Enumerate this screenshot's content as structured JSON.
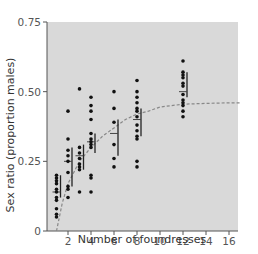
{
  "chart_data": {
    "type": "scatter",
    "title": "",
    "xlabel": "Number of foundresses",
    "ylabel": "Sex ratio (proportion males)",
    "xlim": [
      0,
      18
    ],
    "ylim": [
      0,
      0.75
    ],
    "x_ticks": [
      2,
      4,
      6,
      8,
      10,
      12,
      14,
      16
    ],
    "y_ticks": [
      0,
      0.25,
      0.5,
      0.75
    ],
    "y_tick_labels": [
      "0",
      "0.25",
      "0.50",
      "0.75"
    ],
    "grid": false,
    "background": "#d9d9d9",
    "series": [
      {
        "name": "observations",
        "points": [
          [
            1,
            0.05
          ],
          [
            1,
            0.06
          ],
          [
            1,
            0.08
          ],
          [
            1,
            0.11
          ],
          [
            1,
            0.12
          ],
          [
            1,
            0.14
          ],
          [
            1,
            0.15
          ],
          [
            1,
            0.17
          ],
          [
            1,
            0.18
          ],
          [
            1,
            0.19
          ],
          [
            1,
            0.2
          ],
          [
            2,
            0.12
          ],
          [
            2,
            0.15
          ],
          [
            2,
            0.16
          ],
          [
            2,
            0.21
          ],
          [
            2,
            0.25
          ],
          [
            2,
            0.27
          ],
          [
            2,
            0.29
          ],
          [
            2,
            0.33
          ],
          [
            2,
            0.43
          ],
          [
            3,
            0.14
          ],
          [
            3,
            0.22
          ],
          [
            3,
            0.23
          ],
          [
            3,
            0.24
          ],
          [
            3,
            0.26
          ],
          [
            3,
            0.28
          ],
          [
            3,
            0.3
          ],
          [
            3,
            0.51
          ],
          [
            4,
            0.14
          ],
          [
            4,
            0.19
          ],
          [
            4,
            0.2
          ],
          [
            4,
            0.3
          ],
          [
            4,
            0.31
          ],
          [
            4,
            0.32
          ],
          [
            4,
            0.33
          ],
          [
            4,
            0.35
          ],
          [
            4,
            0.4
          ],
          [
            4,
            0.43
          ],
          [
            4,
            0.45
          ],
          [
            4,
            0.48
          ],
          [
            6,
            0.23
          ],
          [
            6,
            0.26
          ],
          [
            6,
            0.31
          ],
          [
            6,
            0.39
          ],
          [
            6,
            0.44
          ],
          [
            6,
            0.5
          ],
          [
            8,
            0.23
          ],
          [
            8,
            0.25
          ],
          [
            8,
            0.33
          ],
          [
            8,
            0.34
          ],
          [
            8,
            0.36
          ],
          [
            8,
            0.38
          ],
          [
            8,
            0.41
          ],
          [
            8,
            0.43
          ],
          [
            8,
            0.44
          ],
          [
            8,
            0.46
          ],
          [
            8,
            0.48
          ],
          [
            8,
            0.5
          ],
          [
            8,
            0.54
          ],
          [
            12,
            0.41
          ],
          [
            12,
            0.43
          ],
          [
            12,
            0.45
          ],
          [
            12,
            0.46
          ],
          [
            12,
            0.47
          ],
          [
            12,
            0.49
          ],
          [
            12,
            0.52
          ],
          [
            12,
            0.53
          ],
          [
            12,
            0.55
          ],
          [
            12,
            0.56
          ],
          [
            12,
            0.57
          ],
          [
            12,
            0.61
          ]
        ]
      },
      {
        "name": "means",
        "points": [
          [
            1,
            0.14
          ],
          [
            2,
            0.25
          ],
          [
            3,
            0.27
          ],
          [
            4,
            0.32
          ],
          [
            6,
            0.35
          ],
          [
            8,
            0.4
          ],
          [
            12,
            0.5
          ]
        ]
      },
      {
        "name": "error_bars",
        "bars": [
          [
            1,
            0.12,
            0.2
          ],
          [
            2,
            0.16,
            0.3
          ],
          [
            3,
            0.22,
            0.31
          ],
          [
            4,
            0.28,
            0.35
          ],
          [
            6,
            0.27,
            0.4
          ],
          [
            8,
            0.34,
            0.44
          ],
          [
            12,
            0.48,
            0.57
          ]
        ]
      },
      {
        "name": "predicted",
        "style": "dashed",
        "points": [
          [
            1,
            0.0
          ],
          [
            1.5,
            0.1
          ],
          [
            2,
            0.17
          ],
          [
            3,
            0.25
          ],
          [
            4,
            0.3
          ],
          [
            5,
            0.34
          ],
          [
            6,
            0.37
          ],
          [
            7,
            0.4
          ],
          [
            8,
            0.42
          ],
          [
            9,
            0.43
          ],
          [
            10,
            0.445
          ],
          [
            11,
            0.45
          ],
          [
            12,
            0.455
          ],
          [
            14,
            0.458
          ],
          [
            16,
            0.46
          ],
          [
            17,
            0.46
          ]
        ]
      }
    ]
  }
}
